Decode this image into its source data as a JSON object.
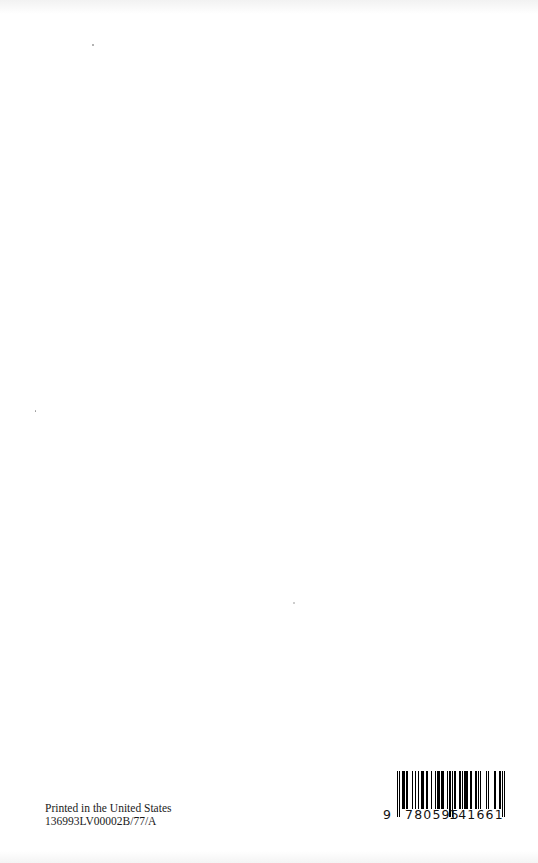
{
  "page": {
    "type": "book back cover",
    "background": "#ffffff"
  },
  "imprint": {
    "line1": "Printed in the United States",
    "line2": "136993LV00002B/77/A"
  },
  "barcode": {
    "isbn": "9780595141661",
    "lead_digit": "9",
    "left_group": "780595",
    "right_group": "141661",
    "color": "#000000"
  }
}
